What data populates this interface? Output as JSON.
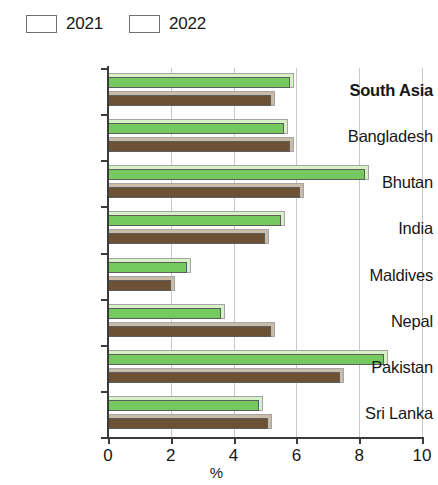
{
  "chart_data": {
    "type": "bar",
    "orientation": "horizontal",
    "title": "",
    "xlabel": "%",
    "ylabel": "",
    "xlim": [
      0,
      10
    ],
    "xticks": [
      0,
      2,
      4,
      6,
      8,
      10
    ],
    "xtick_labels": [
      "0",
      "2",
      "4",
      "6",
      "8",
      "10"
    ],
    "grid": true,
    "grid_axis": "x",
    "legend_position": "top-left",
    "categories": [
      "South Asia",
      "Bangladesh",
      "Bhutan",
      "India",
      "Maldives",
      "Nepal",
      "Pakistan",
      "Sri Lanka"
    ],
    "emphasis_category": "South Asia",
    "series": [
      {
        "name": "2021",
        "color": "#74c95f",
        "values": [
          5.8,
          5.6,
          8.2,
          5.5,
          2.5,
          3.6,
          8.8,
          4.8
        ]
      },
      {
        "name": "2022",
        "color": "#6d5135",
        "values": [
          5.2,
          5.8,
          6.1,
          5.0,
          2.0,
          5.2,
          7.4,
          5.1
        ]
      }
    ]
  }
}
